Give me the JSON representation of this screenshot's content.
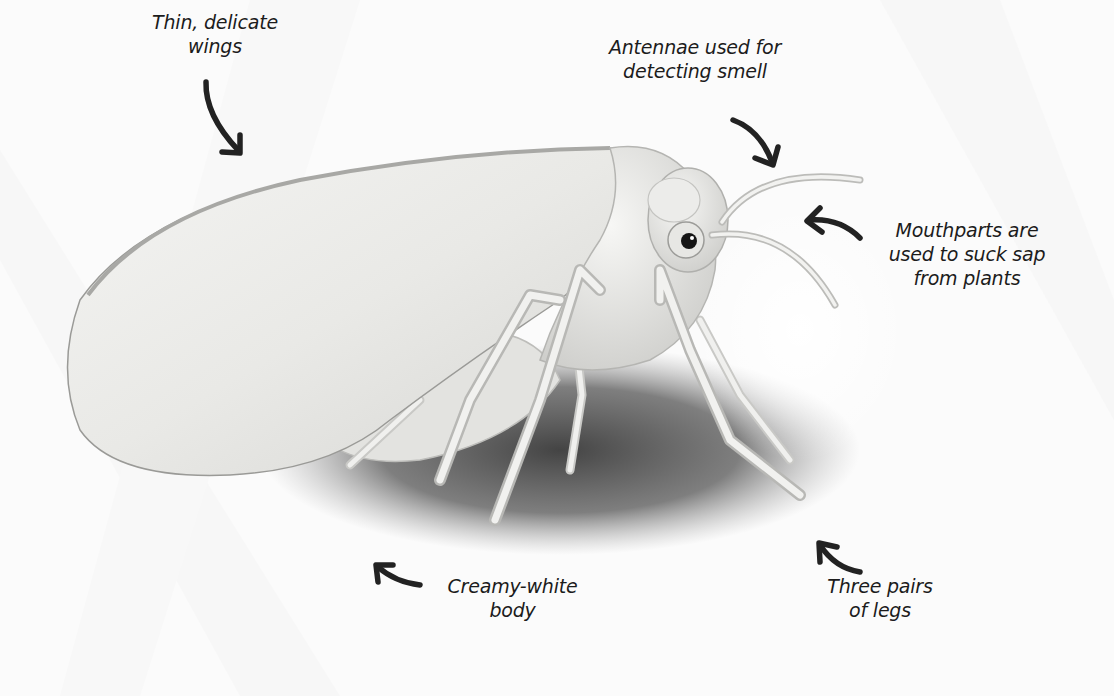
{
  "diagram": {
    "colors": {
      "background": "#fbfbfb",
      "body": "#eeeeec",
      "shadow": "#3a3a3a",
      "text": "#1c1c1c",
      "arrow": "#222222"
    },
    "labels": [
      {
        "id": "wings",
        "lines": [
          "Thin, delicate",
          "wings"
        ],
        "arrow": "arrow-down-right"
      },
      {
        "id": "antennae",
        "lines": [
          "Antennae used for",
          "detecting smell"
        ],
        "arrow": "arrow-down-right"
      },
      {
        "id": "mouthparts",
        "lines": [
          "Mouthparts are",
          "used to suck sap",
          "from plants"
        ],
        "arrow": "arrow-left"
      },
      {
        "id": "body",
        "lines": [
          "Creamy-white",
          "body"
        ],
        "arrow": "arrow-up-left"
      },
      {
        "id": "legs",
        "lines": [
          "Three pairs",
          "of legs"
        ],
        "arrow": "arrow-up-left"
      }
    ]
  }
}
